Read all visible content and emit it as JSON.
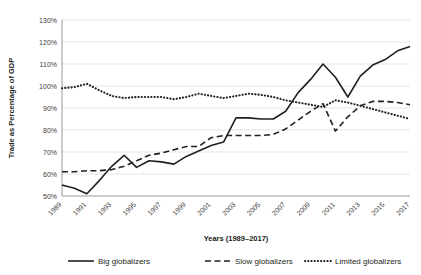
{
  "chart_data": {
    "type": "line",
    "title": "",
    "xlabel": "Years (1989–2017)",
    "ylabel": "Trade as Percentage of GDP",
    "grid": true,
    "legend_position": "bottom",
    "ylim": [
      50,
      130
    ],
    "ytick_labels": [
      "130%",
      "120%",
      "110%",
      "100%",
      "90%",
      "80%",
      "70%",
      "60%",
      "50%"
    ],
    "ytick_values": [
      130,
      120,
      110,
      100,
      90,
      80,
      70,
      60,
      50
    ],
    "xtick_labels": [
      "1989",
      "1991",
      "1993",
      "1995",
      "1997",
      "1999",
      "2001",
      "2003",
      "2005",
      "2007",
      "2009",
      "2011",
      "2013",
      "2015",
      "2017"
    ],
    "x": [
      1989,
      1990,
      1991,
      1992,
      1993,
      1994,
      1995,
      1996,
      1997,
      1998,
      1999,
      2000,
      2001,
      2002,
      2003,
      2004,
      2005,
      2006,
      2007,
      2008,
      2009,
      2010,
      2011,
      2012,
      2013,
      2014,
      2015,
      2016,
      2017
    ],
    "series": [
      {
        "name": "Big globalizers",
        "style": "solid",
        "color": "#231f20",
        "values": [
          55.0,
          53.5,
          51.0,
          57.0,
          63.5,
          68.5,
          63.0,
          66.0,
          65.5,
          64.5,
          68.0,
          70.5,
          73.0,
          74.5,
          85.5,
          85.5,
          85.0,
          85.0,
          88.5,
          97.0,
          103.0,
          110.0,
          104.0,
          95.0,
          104.5,
          109.5,
          112.0,
          116.0,
          118.0
        ]
      },
      {
        "name": "Slow globalizers",
        "style": "dashed",
        "color": "#231f20",
        "values": [
          61.0,
          61.0,
          61.5,
          61.5,
          62.0,
          63.5,
          66.0,
          68.5,
          69.5,
          71.0,
          72.5,
          72.5,
          76.5,
          77.5,
          77.5,
          77.5,
          77.5,
          78.0,
          80.5,
          84.5,
          88.5,
          92.0,
          79.5,
          86.0,
          91.0,
          93.0,
          93.0,
          92.5,
          91.5
        ]
      },
      {
        "name": "Limited globalizers",
        "style": "dotted",
        "color": "#231f20",
        "values": [
          99.0,
          99.5,
          101.0,
          98.0,
          95.5,
          94.5,
          95.0,
          95.0,
          95.0,
          94.0,
          95.0,
          96.5,
          95.5,
          94.5,
          95.5,
          96.5,
          96.0,
          95.0,
          93.5,
          92.5,
          91.5,
          90.5,
          93.5,
          92.5,
          91.0,
          89.5,
          88.0,
          86.5,
          85.0
        ]
      }
    ]
  },
  "legend": {
    "items": [
      {
        "label": "Big globalizers",
        "style": "solid"
      },
      {
        "label": "Slow globalizers",
        "style": "dashed"
      },
      {
        "label": "Limited globalizers",
        "style": "dotted"
      }
    ]
  }
}
